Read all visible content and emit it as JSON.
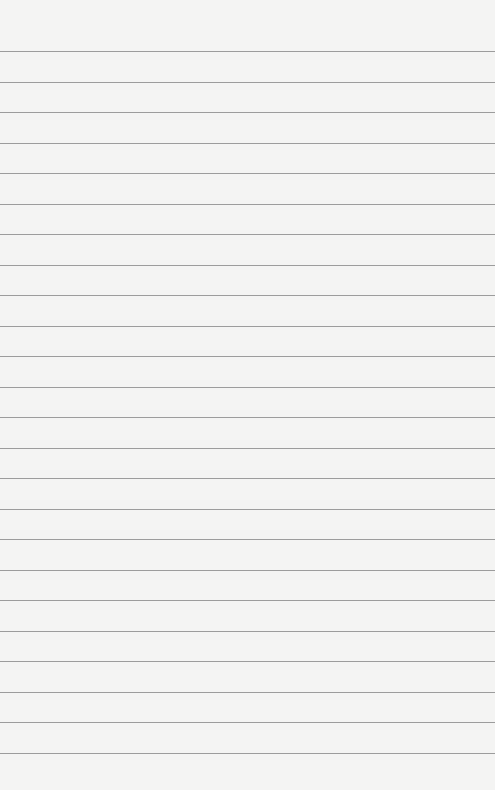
{
  "image": {
    "subject": "blank lined paper",
    "width": 495,
    "height": 790,
    "background_color": "#f4f4f3",
    "line_color": "#8c8c8c",
    "first_line_y": 51,
    "line_spacing": 30.5,
    "line_count": 24
  }
}
